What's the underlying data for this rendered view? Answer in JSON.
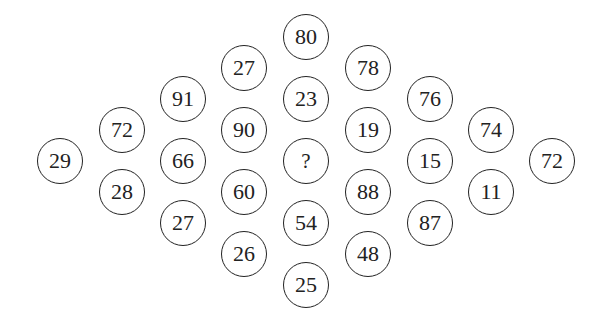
{
  "puzzle": {
    "description": "Diamond arrangement of numbered circles with a missing value",
    "unknown_symbol": "?",
    "columns": [
      {
        "x": 60,
        "cells": [
          {
            "y": 161,
            "value": "29"
          }
        ]
      },
      {
        "x": 122,
        "cells": [
          {
            "y": 130,
            "value": "72"
          },
          {
            "y": 192,
            "value": "28"
          }
        ]
      },
      {
        "x": 183,
        "cells": [
          {
            "y": 99,
            "value": "91"
          },
          {
            "y": 161,
            "value": "66"
          },
          {
            "y": 223,
            "value": "27"
          }
        ]
      },
      {
        "x": 244,
        "cells": [
          {
            "y": 68,
            "value": "27"
          },
          {
            "y": 130,
            "value": "90"
          },
          {
            "y": 192,
            "value": "60"
          },
          {
            "y": 254,
            "value": "26"
          }
        ]
      },
      {
        "x": 306,
        "cells": [
          {
            "y": 37,
            "value": "80"
          },
          {
            "y": 99,
            "value": "23"
          },
          {
            "y": 161,
            "value": "?"
          },
          {
            "y": 223,
            "value": "54"
          },
          {
            "y": 285,
            "value": "25"
          }
        ]
      },
      {
        "x": 368,
        "cells": [
          {
            "y": 68,
            "value": "78"
          },
          {
            "y": 130,
            "value": "19"
          },
          {
            "y": 192,
            "value": "88"
          },
          {
            "y": 254,
            "value": "48"
          }
        ]
      },
      {
        "x": 430,
        "cells": [
          {
            "y": 99,
            "value": "76"
          },
          {
            "y": 161,
            "value": "15"
          },
          {
            "y": 223,
            "value": "87"
          }
        ]
      },
      {
        "x": 491,
        "cells": [
          {
            "y": 130,
            "value": "74"
          },
          {
            "y": 192,
            "value": "11"
          }
        ]
      },
      {
        "x": 552,
        "cells": [
          {
            "y": 161,
            "value": "72"
          }
        ]
      }
    ]
  },
  "style": {
    "stroke_color": "#222222",
    "text_color": "#222222",
    "background": "#ffffff"
  }
}
